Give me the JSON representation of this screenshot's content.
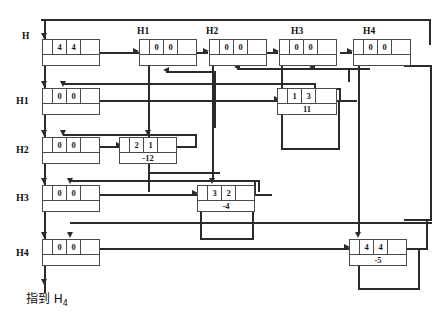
{
  "diagram": {
    "title_caption": "指到 H",
    "caption_sub": "4",
    "row_labels": [
      {
        "name": "H",
        "text": "H"
      },
      {
        "name": "H1",
        "text": "H1"
      },
      {
        "name": "H2",
        "text": "H2"
      },
      {
        "name": "H3",
        "text": "H3"
      },
      {
        "name": "H4",
        "text": "H4"
      }
    ],
    "column_headers": [
      {
        "name": "H",
        "text": "H"
      },
      {
        "name": "H1",
        "text": "H1"
      },
      {
        "name": "H2",
        "text": "H2"
      },
      {
        "name": "H3",
        "text": "H3"
      },
      {
        "name": "H4",
        "text": "H4"
      }
    ],
    "nodes": [
      {
        "id": "head-h",
        "top": [
          "",
          "4",
          "4",
          ""
        ],
        "bottom": "",
        "has_bottom_text": false
      },
      {
        "id": "head-h1",
        "top": [
          "",
          "0",
          "0",
          ""
        ],
        "bottom": "",
        "has_bottom_text": false
      },
      {
        "id": "head-h2",
        "top": [
          "",
          "0",
          "0",
          ""
        ],
        "bottom": "",
        "has_bottom_text": false
      },
      {
        "id": "head-h3",
        "top": [
          "",
          "0",
          "0",
          ""
        ],
        "bottom": "",
        "has_bottom_text": false
      },
      {
        "id": "head-h4",
        "top": [
          "",
          "0",
          "0",
          ""
        ],
        "bottom": "",
        "has_bottom_text": false
      },
      {
        "id": "row-h1",
        "top": [
          "",
          "0",
          "0",
          ""
        ],
        "bottom": "",
        "has_bottom_text": false
      },
      {
        "id": "row-h2",
        "top": [
          "",
          "0",
          "0",
          ""
        ],
        "bottom": "",
        "has_bottom_text": false
      },
      {
        "id": "row-h3",
        "top": [
          "",
          "0",
          "0",
          ""
        ],
        "bottom": "",
        "has_bottom_text": false
      },
      {
        "id": "row-h4",
        "top": [
          "",
          "0",
          "0",
          ""
        ],
        "bottom": "",
        "has_bottom_text": false
      },
      {
        "id": "elem-1-3",
        "top": [
          "",
          "1",
          "3",
          ""
        ],
        "bottom": "11",
        "has_bottom_text": true
      },
      {
        "id": "elem-2-1",
        "top": [
          "",
          "2",
          "1",
          ""
        ],
        "bottom": "-12",
        "has_bottom_text": true
      },
      {
        "id": "elem-3-2",
        "top": [
          "",
          "3",
          "2",
          ""
        ],
        "bottom": "-4",
        "has_bottom_text": true
      },
      {
        "id": "elem-4-4",
        "top": [
          "",
          "4",
          "4",
          ""
        ],
        "bottom": "-5",
        "has_bottom_text": true
      }
    ],
    "colors": {
      "line": "#3a3a3a",
      "border": "#4a4a4a",
      "text": "#111111",
      "background": "#ffffff"
    }
  }
}
